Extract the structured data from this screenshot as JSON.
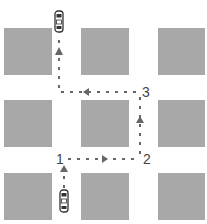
{
  "diagram": {
    "type": "street-grid-route",
    "colors": {
      "block": "#a8a8a8",
      "path": "#666666",
      "label": "#444444",
      "car_outline": "#333333"
    },
    "blocks": [
      {
        "row": 0,
        "col": 0
      },
      {
        "row": 0,
        "col": 1
      },
      {
        "row": 0,
        "col": 2
      },
      {
        "row": 1,
        "col": 0
      },
      {
        "row": 1,
        "col": 1
      },
      {
        "row": 1,
        "col": 2
      },
      {
        "row": 2,
        "col": 0
      },
      {
        "row": 2,
        "col": 1
      },
      {
        "row": 2,
        "col": 2
      }
    ],
    "waypoints": [
      {
        "label": "1",
        "position": "bottom-left intersection"
      },
      {
        "label": "2",
        "position": "bottom-right intersection"
      },
      {
        "label": "3",
        "position": "top-right intersection"
      }
    ],
    "route_arrows": [
      "up",
      "right",
      "up",
      "left",
      "up"
    ],
    "cars": [
      {
        "name": "start-car",
        "position": "bottom",
        "facing": "up"
      },
      {
        "name": "end-car",
        "position": "top",
        "facing": "up"
      }
    ]
  }
}
